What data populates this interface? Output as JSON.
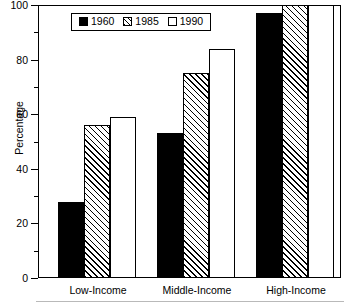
{
  "chart_data": {
    "type": "bar",
    "title": "",
    "subtitle": "",
    "xlabel": "",
    "ylabel": "Percentage",
    "ylim": [
      0,
      100
    ],
    "ytick_labels": [
      "0",
      "20",
      "40",
      "60",
      "80",
      "100"
    ],
    "ytick_values": [
      0,
      20,
      40,
      60,
      80,
      100
    ],
    "yminor_values": [
      10,
      30,
      50,
      70,
      90
    ],
    "grid": false,
    "legend_position": "top-left-inside",
    "categories": [
      "Low-Income",
      "Middle-Income",
      "High-Income"
    ],
    "series": [
      {
        "name": "1960",
        "values": [
          28,
          53,
          97
        ],
        "style": "solid-black",
        "color": "#000000"
      },
      {
        "name": "1985",
        "values": [
          56,
          75,
          100
        ],
        "style": "hatched",
        "color": "#ffffff"
      },
      {
        "name": "1990",
        "values": [
          59,
          84,
          100
        ],
        "style": "open-white",
        "color": "#ffffff"
      }
    ]
  },
  "legend": {
    "entries": [
      {
        "label": "1960",
        "swatch": "solid-black-swatch"
      },
      {
        "label": "1985",
        "swatch": "hatched-swatch"
      },
      {
        "label": "1990",
        "swatch": "open-white-swatch"
      }
    ]
  },
  "axes": {
    "y_title": "Percentage",
    "y_ticks": [
      "100",
      "80",
      "60",
      "40",
      "20",
      "0"
    ],
    "x_ticks": [
      "Low-Income",
      "Middle-Income",
      "High-Income"
    ]
  }
}
